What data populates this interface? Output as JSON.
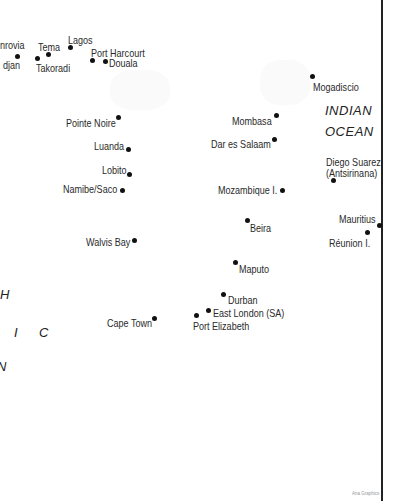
{
  "map": {
    "oceans": [
      {
        "name": "indian-ocean-line1",
        "text": "INDIAN"
      },
      {
        "name": "indian-ocean-line2",
        "text": "OCEAN"
      }
    ],
    "atlantic_fragments": [
      "H",
      "I",
      "C",
      "N"
    ],
    "ports": [
      {
        "name": "Monrovia",
        "label": "nrovia"
      },
      {
        "name": "Abidjan",
        "label": "djan"
      },
      {
        "name": "Tema",
        "label": "Tema"
      },
      {
        "name": "Takoradi",
        "label": "Takoradi"
      },
      {
        "name": "Lagos",
        "label": "Lagos"
      },
      {
        "name": "Port Harcourt",
        "label": "Port Harcourt"
      },
      {
        "name": "Douala",
        "label": "Douala"
      },
      {
        "name": "Mogadiscio",
        "label": "Mogadiscio"
      },
      {
        "name": "Pointe Noire",
        "label": "Pointe Noire"
      },
      {
        "name": "Mombasa",
        "label": "Mombasa"
      },
      {
        "name": "Dar es Salaam",
        "label": "Dar es Salaam"
      },
      {
        "name": "Luanda",
        "label": "Luanda"
      },
      {
        "name": "Lobito",
        "label": "Lobito"
      },
      {
        "name": "Diego Suarez",
        "label": "Diego Suarez"
      },
      {
        "name": "Antsirinana",
        "label": "(Antsirinana)"
      },
      {
        "name": "Namibe/Saco",
        "label": "Namibe/Saco"
      },
      {
        "name": "Mozambique I.",
        "label": "Mozambique I."
      },
      {
        "name": "Beira",
        "label": "Beira"
      },
      {
        "name": "Mauritius",
        "label": "Mauritius"
      },
      {
        "name": "Walvis Bay",
        "label": "Walvis Bay"
      },
      {
        "name": "Reunion I.",
        "label": "Réunion I."
      },
      {
        "name": "Maputo",
        "label": "Maputo"
      },
      {
        "name": "Durban",
        "label": "Durban"
      },
      {
        "name": "East London (SA)",
        "label": "East London (SA)"
      },
      {
        "name": "Cape Town",
        "label": "Cape Town"
      },
      {
        "name": "Port Elizabeth",
        "label": "Port Elizabeth"
      }
    ],
    "credit": "Ana Graphics"
  }
}
